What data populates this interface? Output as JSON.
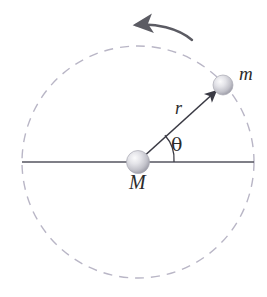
{
  "figure": {
    "type": "physics-diagram",
    "background_color": "#ffffff"
  },
  "labels": {
    "central_mass": "M",
    "orbiting_mass": "m",
    "radius": "r",
    "angle": "θ"
  },
  "geometry": {
    "center": {
      "x": 138,
      "y": 162
    },
    "orbit_radius_px": 116,
    "orbiting_body": {
      "x": 222,
      "y": 86
    },
    "angle_degrees": 42,
    "angle_arc_radius_px": 36,
    "axis_line": {
      "x1": 22,
      "y1": 162,
      "x2": 254,
      "y2": 162
    }
  },
  "elements": {
    "orbit_path": {
      "name": "dashed-orbit-circle",
      "style": "dashed",
      "color": "#b9b6c6"
    },
    "axis": {
      "name": "horizontal-reference-axis",
      "color": "#555560"
    },
    "radius_vector": {
      "name": "radius-arrow",
      "color": "#3a3a44",
      "arrowhead": "at orbiting mass"
    },
    "rotation_arrow": {
      "name": "rotation-direction-arrow",
      "direction": "counterclockwise",
      "color": "#5b5b63"
    },
    "spheres": {
      "color_light": "#f2f2f4",
      "color_mid": "#c9c9cf",
      "color_dark": "#9a9aa4"
    }
  }
}
